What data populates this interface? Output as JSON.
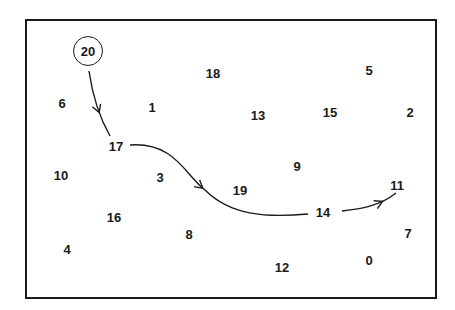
{
  "diagram": {
    "title": "",
    "frame": {
      "stroke": "#1a1a1a"
    },
    "start_node": "20",
    "nodes": [
      {
        "label": "20",
        "x": 88,
        "y": 51,
        "circled": true
      },
      {
        "label": "18",
        "x": 213,
        "y": 73
      },
      {
        "label": "5",
        "x": 369,
        "y": 70
      },
      {
        "label": "6",
        "x": 62,
        "y": 103
      },
      {
        "label": "1",
        "x": 152,
        "y": 107
      },
      {
        "label": "13",
        "x": 258,
        "y": 115
      },
      {
        "label": "15",
        "x": 330,
        "y": 112
      },
      {
        "label": "2",
        "x": 410,
        "y": 112
      },
      {
        "label": "17",
        "x": 116,
        "y": 146
      },
      {
        "label": "9",
        "x": 297,
        "y": 166
      },
      {
        "label": "10",
        "x": 61,
        "y": 175
      },
      {
        "label": "3",
        "x": 160,
        "y": 177
      },
      {
        "label": "19",
        "x": 240,
        "y": 190
      },
      {
        "label": "11",
        "x": 397,
        "y": 185
      },
      {
        "label": "14",
        "x": 323,
        "y": 212
      },
      {
        "label": "16",
        "x": 114,
        "y": 217
      },
      {
        "label": "8",
        "x": 189,
        "y": 234
      },
      {
        "label": "7",
        "x": 408,
        "y": 233
      },
      {
        "label": "4",
        "x": 67,
        "y": 249
      },
      {
        "label": "0",
        "x": 369,
        "y": 260
      },
      {
        "label": "12",
        "x": 282,
        "y": 267
      }
    ],
    "path": [
      "20",
      "17",
      "14",
      "11"
    ],
    "edges": [
      {
        "from": "20",
        "to": "17",
        "d": "M 89 71 C 92 92, 98 115, 110 136",
        "arrow_at": [
          100,
          112
        ]
      },
      {
        "from": "17",
        "to": "14",
        "d": "M 130 145 C 175 142, 185 175, 205 190 C 230 215, 265 218, 308 214",
        "arrow_at": [
          203,
          188
        ]
      },
      {
        "from": "14",
        "to": "11",
        "d": "M 342 211 C 360 209, 380 206, 396 193",
        "arrow_at": [
          383,
          203
        ]
      }
    ]
  }
}
